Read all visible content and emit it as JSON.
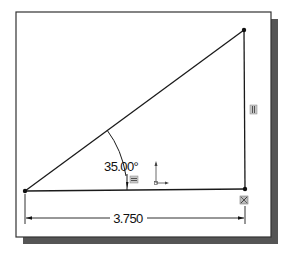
{
  "sketch": {
    "angle_dimension": {
      "value": "35.00°"
    },
    "linear_dimension": {
      "value": "3.750"
    },
    "constraints": [
      {
        "name": "vertical",
        "glyph": "vertical-relation-icon"
      },
      {
        "name": "horizontal",
        "glyph": "horizontal-relation-icon"
      },
      {
        "name": "fixed",
        "glyph": "fixed-relation-icon"
      }
    ],
    "origin": {
      "glyph": "sketch-origin-icon"
    },
    "colors": {
      "line": "#1a1a1a",
      "frame_border": "#333333",
      "shadow": "#555555",
      "relation_fill": "#c8c8c8"
    }
  }
}
